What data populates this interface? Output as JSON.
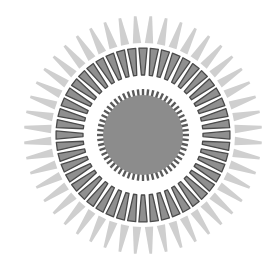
{
  "figure": {
    "center": [
      143,
      135
    ],
    "outer_rays": {
      "count": 48,
      "inner_radius": 92,
      "outer_radius": 119,
      "base_half_angle_deg": 2.6,
      "color": "#cfcfcf"
    },
    "dark_ring": {
      "count": 48,
      "inner_radius": 60,
      "outer_radius": 87,
      "base_half_angle_deg": 2.7,
      "tip_half_angle_deg": 0.7,
      "fill": "#8f8f8f",
      "stroke": "#4a4a4a"
    },
    "inner_spikes": {
      "count": 56,
      "inner_radius": 36,
      "outer_radius": 46,
      "width": 2.4,
      "color": "#5a5a5a"
    },
    "core_disk": {
      "radius": 40,
      "color": "#8c8c8c"
    }
  }
}
